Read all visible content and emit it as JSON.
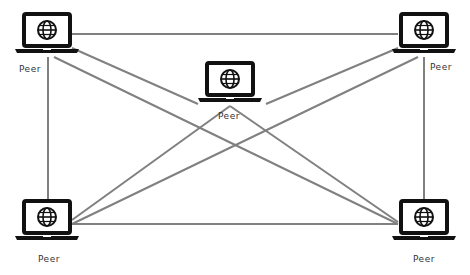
{
  "diagram": {
    "colors": {
      "line": "#808080",
      "device": "#111111",
      "background": "#ffffff"
    },
    "nodes": [
      {
        "id": "top-left",
        "label": "Peer",
        "icon": "laptop-globe-icon",
        "x": 47,
        "y": 34,
        "labelX": 19,
        "labelY": 64
      },
      {
        "id": "center",
        "label": "Peer",
        "icon": "laptop-globe-icon",
        "x": 230,
        "y": 83,
        "labelX": 218,
        "labelY": 111
      },
      {
        "id": "top-right",
        "label": "Peer",
        "icon": "laptop-globe-icon",
        "x": 424,
        "y": 34,
        "labelX": 430,
        "labelY": 62
      },
      {
        "id": "bottom-left",
        "label": "Peer",
        "icon": "laptop-globe-icon",
        "x": 47,
        "y": 221,
        "labelX": 38,
        "labelY": 254
      },
      {
        "id": "bottom-right",
        "label": "Peer",
        "icon": "laptop-globe-icon",
        "x": 424,
        "y": 221,
        "labelX": 413,
        "labelY": 254
      }
    ],
    "edges": [
      {
        "x1": 72,
        "y1": 34,
        "x2": 398,
        "y2": 34
      },
      {
        "x1": 48,
        "y1": 57,
        "x2": 48,
        "y2": 207
      },
      {
        "x1": 424,
        "y1": 57,
        "x2": 424,
        "y2": 207
      },
      {
        "x1": 72,
        "y1": 224,
        "x2": 398,
        "y2": 224
      },
      {
        "x1": 72,
        "y1": 48,
        "x2": 198,
        "y2": 104
      },
      {
        "x1": 54,
        "y1": 57,
        "x2": 398,
        "y2": 224
      },
      {
        "x1": 266,
        "y1": 104,
        "x2": 398,
        "y2": 48
      },
      {
        "x1": 418,
        "y1": 57,
        "x2": 72,
        "y2": 224
      },
      {
        "x1": 230,
        "y1": 106,
        "x2": 398,
        "y2": 222
      },
      {
        "x1": 230,
        "y1": 106,
        "x2": 72,
        "y2": 220
      }
    ]
  }
}
